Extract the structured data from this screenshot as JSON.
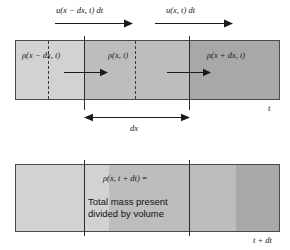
{
  "figure": {
    "title_label": "continuity-equation-control-volume-diagram",
    "colors": {
      "band_light": "#d2d2d2",
      "band_medium": "#bdbdbd",
      "band_dark": "#a8a8a8",
      "box_border": "#4a4a4a",
      "rule": "#2b2b2b",
      "dashed_rule": "#3a3a3a",
      "text": "#1a1a1a",
      "background": "#ffffff"
    }
  },
  "top_panel": {
    "flux_labels": [
      {
        "id": "left-flux",
        "text": "u(x − dx, t) dt"
      },
      {
        "id": "right-flux",
        "text": "u(x, t) dt"
      }
    ],
    "density_labels": [
      {
        "id": "density-left",
        "text": "ρ(x − dx, t)"
      },
      {
        "id": "density-center",
        "text": "ρ(x, t)"
      },
      {
        "id": "density-right",
        "text": "ρ(x + dx, t)"
      }
    ],
    "time_label": "t",
    "extent_label": "dx"
  },
  "bottom_panel": {
    "density_expression": "ρ(x, t + dt) =",
    "description_lines": [
      "Total mass present",
      "divided by volume"
    ],
    "time_label": "t + dt"
  }
}
